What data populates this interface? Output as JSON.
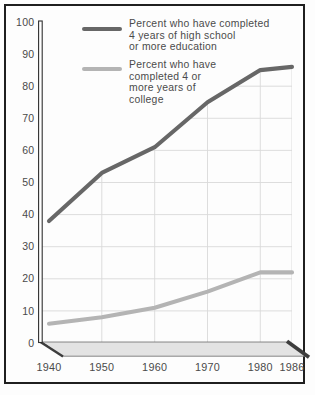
{
  "chart_data": {
    "type": "line",
    "title": "",
    "xlabel": "",
    "ylabel": "",
    "categories": [
      1940,
      1950,
      1960,
      1970,
      1980,
      1986
    ],
    "series": [
      {
        "name": "Percent who have completed\n4 years of high school\nor more education",
        "values": [
          38,
          53,
          61,
          75,
          85,
          86
        ],
        "color": "#676767"
      },
      {
        "name": "Percent who have\ncompleted 4 or\nmore years of\ncollege",
        "values": [
          6,
          8,
          11,
          16,
          22,
          22
        ],
        "color": "#b4b4b4"
      }
    ],
    "ylim": [
      0,
      100
    ],
    "ytick_step": 10,
    "grid": true,
    "grid_color": "#d9d9d9",
    "legend_position": "top-left-inside",
    "frame_color": "#1f1f1f",
    "axis_color": "#3d3d3d"
  }
}
